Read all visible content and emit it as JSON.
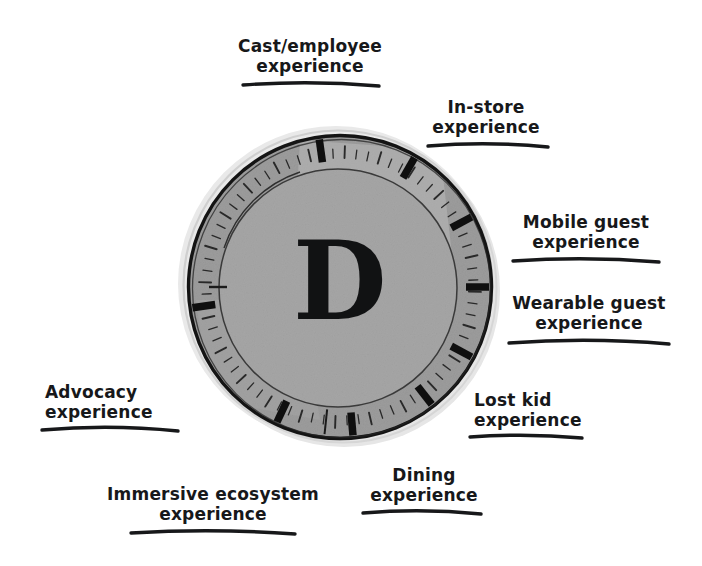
{
  "diagram": {
    "center_letter": "D",
    "background_color": "#ffffff",
    "ink_color": "#17181a",
    "dial_fill_outer": "#9a9a9a",
    "dial_fill_inner": "#a4a4a4",
    "dial_highlight": "#b8b8b8",
    "shadow_color": "#e3e3e3",
    "dial": {
      "center_x": 340,
      "center_y": 287,
      "outer_radius": 152,
      "ring_inner_radius": 127,
      "inner_disc_radius": 117,
      "major_ticks_deg": [
        -8,
        30,
        62,
        90,
        118,
        142,
        175,
        205,
        262
      ],
      "minor_tick_count": 72
    },
    "labels": [
      {
        "id": "cast-employee-experience",
        "lines": [
          "Cast/employee",
          "experience"
        ],
        "x": 228,
        "y": 36,
        "width": 164,
        "align": "center",
        "underline": {
          "x": 243,
          "y": 85,
          "w": 136,
          "h": 9,
          "bow": -5
        }
      },
      {
        "id": "in-store-experience",
        "lines": [
          "In-store",
          "experience"
        ],
        "x": 424,
        "y": 97,
        "width": 124,
        "align": "center",
        "underline": {
          "x": 428,
          "y": 146,
          "w": 120,
          "h": 9,
          "bow": -5
        }
      },
      {
        "id": "mobile-guest-experience",
        "lines": [
          "Mobile guest",
          "experience"
        ],
        "x": 512,
        "y": 212,
        "width": 148,
        "align": "center",
        "underline": {
          "x": 513,
          "y": 261,
          "w": 146,
          "h": 9,
          "bow": -5
        }
      },
      {
        "id": "wearable-guest-experience",
        "lines": [
          "Wearable guest",
          "experience"
        ],
        "x": 506,
        "y": 293,
        "width": 166,
        "align": "center",
        "underline": {
          "x": 509,
          "y": 343,
          "w": 160,
          "h": 9,
          "bow": -6
        }
      },
      {
        "id": "lost-kid-experience",
        "lines": [
          "Lost kid",
          "experience"
        ],
        "x": 474,
        "y": 390,
        "width": 116,
        "align": "left",
        "underline": {
          "x": 470,
          "y": 437,
          "w": 112,
          "h": 9,
          "bow": -4
        }
      },
      {
        "id": "dining-experience",
        "lines": [
          "Dining",
          "experience"
        ],
        "x": 365,
        "y": 465,
        "width": 118,
        "align": "center",
        "underline": {
          "x": 363,
          "y": 513,
          "w": 118,
          "h": 9,
          "bow": -5
        }
      },
      {
        "id": "immersive-ecosystem-experience",
        "lines": [
          "Immersive ecosystem",
          "experience"
        ],
        "x": 104,
        "y": 484,
        "width": 218,
        "align": "center",
        "underline": {
          "x": 131,
          "y": 533,
          "w": 164,
          "h": 9,
          "bow": -5
        }
      },
      {
        "id": "advocacy-experience",
        "lines": [
          "Advocacy",
          "experience"
        ],
        "x": 45,
        "y": 382,
        "width": 134,
        "align": "left",
        "underline": {
          "x": 42,
          "y": 430,
          "w": 136,
          "h": 9,
          "bow": -6
        }
      }
    ]
  }
}
